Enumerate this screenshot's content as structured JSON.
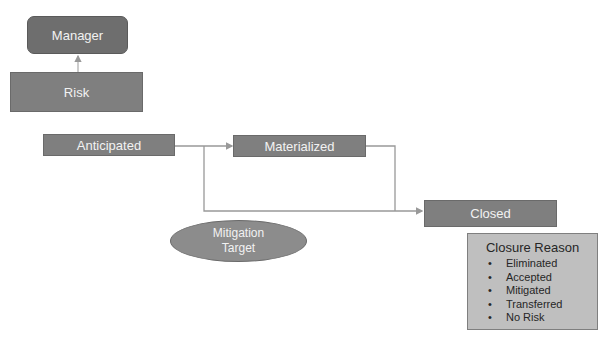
{
  "diagram": {
    "nodes": {
      "manager": {
        "label": "Manager"
      },
      "risk": {
        "label": "Risk"
      },
      "anticipated": {
        "label": "Anticipated"
      },
      "materialized": {
        "label": "Materialized"
      },
      "closed": {
        "label": "Closed"
      },
      "mitigation_target": {
        "line1": "Mitigation",
        "line2": "Target"
      }
    },
    "closure_reason": {
      "title": "Closure Reason",
      "bullet": "•",
      "items": [
        "Eliminated",
        "Accepted",
        "Mitigated",
        "Transferred",
        "No Risk"
      ]
    },
    "edges": [
      {
        "from": "Risk",
        "to": "Manager"
      },
      {
        "from": "Anticipated",
        "to": "Materialized"
      },
      {
        "from": "Anticipated",
        "to": "Closed"
      },
      {
        "from": "Materialized",
        "to": "Closed"
      }
    ],
    "colors": {
      "node": "#7f7f7f",
      "manager": "#6e6e6e",
      "ellipse": "#8c8c8c",
      "reason_bg": "#bfbfbf",
      "connector": "#999999"
    }
  }
}
